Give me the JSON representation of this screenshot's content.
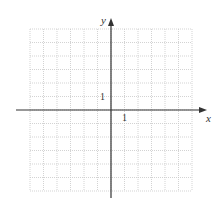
{
  "diagram": {
    "type": "coordinate-grid",
    "x_axis_label": "x",
    "y_axis_label": "y",
    "x_unit_label": "1",
    "y_unit_label": "1",
    "x_range": [
      -6,
      6
    ],
    "y_range": [
      -6,
      6
    ],
    "grid_step": 1,
    "colors": {
      "grid": "#c8c8c8",
      "axis": "#333333",
      "background": "#ffffff"
    }
  }
}
